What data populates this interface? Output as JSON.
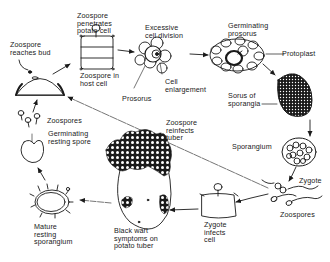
{
  "diagram": {
    "type": "life-cycle",
    "colors": {
      "ink": "#1a1a1a",
      "background": "#ffffff"
    },
    "labels": {
      "zoospore_reaches_bud": "Zoospore\nreaches bud",
      "zoospore_penetrates": "Zoospore\npenetrates\npotato cell",
      "zoospore_in_host": "Zoospore in\nhost cell",
      "excessive_division": "Excessive\ncell division",
      "prosorus": "Prosorus",
      "cell_enlargement": "Cell\nenlargement",
      "germinating_prosorus": "Germinating\nprosorus",
      "protoplast": "Protoplast",
      "sorus_of_sporangia": "Sorus of\nsporangia",
      "sporangium": "Sporangium",
      "zygote": "Zygote",
      "zoospores_right": "Zoospores",
      "zygote_infects_cell": "Zygote\ninfects\ncell",
      "zoospore_reinfects_tuber": "Zoospore\nreinfects\ntuber",
      "black_wart_symptoms": "Black wart\nsymptoms on\npotato tuber",
      "mature_resting_sporangium": "Mature\nresting\nsporangium",
      "germinating_resting_spore": "Germinating\nresting spore",
      "zoospores_left": "Zoospores"
    },
    "stages": [
      "Zoospore reaches bud",
      "Zoospore penetrates potato cell",
      "Excessive cell division",
      "Germinating prosorus",
      "Sorus of sporangia",
      "Sporangium",
      "Zoospores / Zygote",
      "Zygote infects cell",
      "Black wart symptoms on potato tuber",
      "Mature resting sporangium",
      "Germinating resting spore",
      "Zoospores"
    ]
  }
}
